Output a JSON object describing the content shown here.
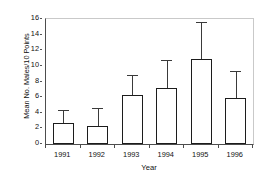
{
  "chart_data": {
    "type": "bar",
    "title": "",
    "xlabel": "Year",
    "ylabel": "Mean No. Males/10 Points",
    "categories": [
      "1991",
      "1992",
      "1993",
      "1994",
      "1995",
      "1996"
    ],
    "values": [
      2.7,
      2.3,
      6.3,
      7.2,
      10.9,
      5.9
    ],
    "error_upper": [
      4.3,
      4.6,
      8.8,
      10.7,
      15.6,
      9.4
    ],
    "errorbar_style": "upper-only",
    "ylim": [
      0,
      16
    ],
    "yticks": [
      0,
      2,
      4,
      6,
      8,
      10,
      12,
      14,
      16
    ],
    "ytick_labels": [
      "0",
      "2",
      "4",
      "6",
      "8",
      "10",
      "12",
      "14",
      "16"
    ],
    "grid": false,
    "legend": false,
    "legend_position": "none",
    "bar_fill": "#ffffff",
    "bar_edge": "#1c1c1c",
    "error_color": "#3a3a3a",
    "axis_color": "#4d4d4d",
    "frame_light_color": "#c9c9c9",
    "background": "#ffffff"
  }
}
